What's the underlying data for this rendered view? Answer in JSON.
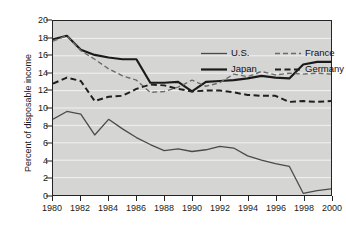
{
  "chart_data": {
    "type": "line",
    "title": "",
    "subtitle": "",
    "xlabel": "",
    "ylabel": "Percent of disposable income",
    "xlim": [
      1980,
      2000
    ],
    "ylim": [
      0,
      20
    ],
    "ytick_step": 2,
    "grid": "horizontal",
    "legend_position": "top-right-inside",
    "x_tick_labels": [
      "1980",
      "1982",
      "1984",
      "1986",
      "1988",
      "1990",
      "1992",
      "1994",
      "1996",
      "1998",
      "2000"
    ],
    "y_tick_labels": [
      "0",
      "2",
      "4",
      "6",
      "8",
      "10",
      "12",
      "14",
      "16",
      "18",
      "20"
    ],
    "x": [
      1980,
      1981,
      1982,
      1983,
      1984,
      1985,
      1986,
      1987,
      1988,
      1989,
      1990,
      1991,
      1992,
      1993,
      1994,
      1995,
      1996,
      1997,
      1998,
      1999,
      2000
    ],
    "series": [
      {
        "name": "U.S.",
        "style": "solid",
        "width": 1.3,
        "color": "#4a4a4a",
        "values": [
          8.7,
          9.6,
          9.3,
          6.9,
          8.7,
          7.6,
          6.6,
          5.8,
          5.1,
          5.3,
          5.0,
          5.2,
          5.6,
          5.4,
          4.5,
          4.0,
          3.6,
          3.3,
          0.2,
          0.5,
          0.7
        ]
      },
      {
        "name": "Japan",
        "style": "solid",
        "width": 2.2,
        "color": "#1a1a1a",
        "values": [
          17.9,
          18.3,
          16.7,
          16.1,
          15.8,
          15.6,
          15.6,
          12.9,
          12.9,
          13.0,
          11.9,
          13.0,
          13.1,
          13.2,
          13.4,
          13.7,
          13.5,
          13.4,
          15.0,
          15.3,
          15.3
        ]
      },
      {
        "name": "France",
        "style": "dashed-light",
        "width": 1.4,
        "color": "#6b6b6b",
        "values": [
          17.7,
          18.3,
          16.6,
          15.6,
          14.5,
          13.7,
          13.2,
          11.8,
          11.9,
          12.4,
          13.2,
          12.5,
          12.9,
          13.9,
          13.6,
          14.2,
          13.8,
          14.0,
          13.9,
          14.0,
          13.9
        ]
      },
      {
        "name": "Germany",
        "style": "dashed-dark",
        "width": 2.0,
        "color": "#1f1f1f",
        "values": [
          12.8,
          13.5,
          13.1,
          10.8,
          11.3,
          11.4,
          12.2,
          12.7,
          12.6,
          12.2,
          11.9,
          12.0,
          12.0,
          11.8,
          11.5,
          11.4,
          11.4,
          10.7,
          10.8,
          10.7,
          10.8
        ]
      }
    ],
    "colors": {
      "plot_background": "#d5d5d3",
      "gridline": "#f2f2f0",
      "axis": "#232323",
      "text": "#1a1a1a",
      "page_background": "#ffffff"
    }
  },
  "legend": {
    "entries": [
      {
        "label": "U.S.",
        "series": "U.S."
      },
      {
        "label": "France",
        "series": "France"
      },
      {
        "label": "Japan",
        "series": "Japan"
      },
      {
        "label": "Germany",
        "series": "Germany"
      }
    ]
  }
}
